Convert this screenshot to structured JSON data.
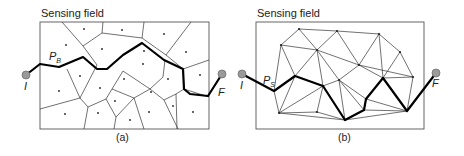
{
  "panels": [
    {
      "id": "a",
      "title": "Sensing field",
      "caption": "(a)",
      "frame": {
        "x": 40,
        "y": 22,
        "w": 169,
        "h": 107
      },
      "path_label": {
        "main": "P",
        "sub": "B",
        "x": 49,
        "y": 60
      },
      "start": {
        "label": "I",
        "x": 26,
        "y": 75,
        "lx": 24,
        "ly": 90
      },
      "end": {
        "label": "F",
        "x": 222,
        "y": 74,
        "lx": 218,
        "ly": 96
      },
      "edges": [
        [
          62,
          22,
          83,
          46
        ],
        [
          103,
          22,
          102,
          33
        ],
        [
          144,
          22,
          142,
          38
        ],
        [
          191,
          22,
          166,
          55
        ],
        [
          83,
          46,
          102,
          33
        ],
        [
          102,
          33,
          142,
          38
        ],
        [
          142,
          38,
          166,
          55
        ],
        [
          83,
          46,
          97,
          65
        ],
        [
          166,
          55,
          183,
          69
        ],
        [
          183,
          69,
          209,
          60
        ],
        [
          183,
          69,
          184,
          89
        ],
        [
          184,
          89,
          209,
          97
        ],
        [
          40,
          109,
          80,
          98
        ],
        [
          80,
          98,
          97,
          65
        ],
        [
          80,
          98,
          67,
          69
        ],
        [
          80,
          98,
          88,
          107
        ],
        [
          88,
          107,
          84,
          129
        ],
        [
          88,
          107,
          106,
          99
        ],
        [
          106,
          99,
          112,
          89
        ],
        [
          106,
          99,
          116,
          117
        ],
        [
          116,
          117,
          114,
          129
        ],
        [
          116,
          117,
          134,
          98
        ],
        [
          134,
          98,
          150,
          89
        ],
        [
          134,
          98,
          144,
          129
        ],
        [
          112,
          89,
          123,
          71
        ],
        [
          112,
          89,
          134,
          98
        ],
        [
          150,
          89,
          163,
          77
        ],
        [
          150,
          89,
          164,
          100
        ],
        [
          164,
          100,
          178,
          129
        ],
        [
          164,
          100,
          176,
          94
        ],
        [
          176,
          94,
          184,
          89
        ],
        [
          176,
          94,
          177,
          129
        ],
        [
          123,
          71,
          150,
          89
        ],
        [
          163,
          77,
          165,
          60
        ]
      ],
      "sites": [
        [
          84,
          29
        ],
        [
          122,
          30
        ],
        [
          164,
          34
        ],
        [
          66,
          45
        ],
        [
          102,
          49
        ],
        [
          144,
          51
        ],
        [
          186,
          52
        ],
        [
          80,
          76
        ],
        [
          143,
          64
        ],
        [
          100,
          88
        ],
        [
          124,
          79
        ],
        [
          168,
          79
        ],
        [
          59,
          91
        ],
        [
          200,
          75
        ],
        [
          115,
          101
        ],
        [
          151,
          92
        ],
        [
          65,
          114
        ],
        [
          98,
          113
        ],
        [
          130,
          120
        ],
        [
          149,
          112
        ],
        [
          173,
          106
        ],
        [
          193,
          112
        ]
      ],
      "path": [
        [
          26,
          75
        ],
        [
          40,
          64
        ],
        [
          59,
          67
        ],
        [
          83,
          57
        ],
        [
          97,
          69
        ],
        [
          107,
          69
        ],
        [
          123,
          55
        ],
        [
          142,
          43
        ],
        [
          164,
          60
        ],
        [
          183,
          69
        ],
        [
          184,
          89
        ],
        [
          190,
          94
        ],
        [
          208,
          96
        ],
        [
          222,
          74
        ]
      ]
    },
    {
      "id": "b",
      "title": "Sensing field",
      "caption": "(b)",
      "frame": {
        "x": 256,
        "y": 22,
        "w": 168,
        "h": 107
      },
      "path_label": {
        "main": "P",
        "sub": "S",
        "x": 263,
        "y": 84
      },
      "start": {
        "label": "I",
        "x": 242,
        "y": 74,
        "lx": 240,
        "ly": 89
      },
      "end": {
        "label": "F",
        "x": 436,
        "y": 73,
        "lx": 432,
        "ly": 87
      },
      "vertices": [
        [
          299,
          29
        ],
        [
          337,
          31
        ],
        [
          379,
          34
        ],
        [
          281,
          45
        ],
        [
          317,
          50
        ],
        [
          359,
          65
        ],
        [
          400,
          52
        ],
        [
          413,
          77
        ],
        [
          339,
          80
        ],
        [
          383,
          78
        ],
        [
          274,
          91
        ],
        [
          295,
          76
        ],
        [
          323,
          86
        ],
        [
          279,
          113
        ],
        [
          317,
          112
        ],
        [
          345,
          120
        ],
        [
          364,
          110
        ],
        [
          407,
          111
        ],
        [
          366,
          99
        ]
      ],
      "edges": [
        [
          299,
          29,
          337,
          31
        ],
        [
          337,
          31,
          379,
          34
        ],
        [
          299,
          29,
          281,
          45
        ],
        [
          299,
          29,
          317,
          50
        ],
        [
          337,
          31,
          317,
          50
        ],
        [
          337,
          31,
          359,
          65
        ],
        [
          379,
          34,
          359,
          65
        ],
        [
          379,
          34,
          400,
          52
        ],
        [
          379,
          34,
          383,
          78
        ],
        [
          281,
          45,
          317,
          50
        ],
        [
          281,
          45,
          274,
          91
        ],
        [
          281,
          45,
          295,
          76
        ],
        [
          317,
          50,
          295,
          76
        ],
        [
          317,
          50,
          323,
          86
        ],
        [
          317,
          50,
          359,
          65
        ],
        [
          317,
          50,
          339,
          80
        ],
        [
          359,
          65,
          339,
          80
        ],
        [
          359,
          65,
          383,
          78
        ],
        [
          359,
          65,
          413,
          77
        ],
        [
          400,
          52,
          413,
          77
        ],
        [
          400,
          52,
          383,
          78
        ],
        [
          413,
          77,
          407,
          111
        ],
        [
          413,
          77,
          383,
          78
        ],
        [
          383,
          78,
          366,
          99
        ],
        [
          383,
          78,
          407,
          111
        ],
        [
          339,
          80,
          323,
          86
        ],
        [
          339,
          80,
          366,
          99
        ],
        [
          339,
          80,
          345,
          120
        ],
        [
          339,
          80,
          364,
          110
        ],
        [
          295,
          76,
          274,
          91
        ],
        [
          295,
          76,
          279,
          113
        ],
        [
          295,
          76,
          323,
          86
        ],
        [
          323,
          86,
          279,
          113
        ],
        [
          323,
          86,
          317,
          112
        ],
        [
          323,
          86,
          345,
          120
        ],
        [
          274,
          91,
          279,
          113
        ],
        [
          279,
          113,
          317,
          112
        ],
        [
          317,
          112,
          345,
          120
        ],
        [
          345,
          120,
          364,
          110
        ],
        [
          364,
          110,
          366,
          99
        ],
        [
          364,
          110,
          407,
          111
        ],
        [
          366,
          99,
          407,
          111
        ],
        [
          279,
          113,
          345,
          120
        ],
        [
          345,
          120,
          407,
          111
        ]
      ],
      "path": [
        [
          242,
          74
        ],
        [
          274,
          91
        ],
        [
          295,
          76
        ],
        [
          323,
          86
        ],
        [
          345,
          120
        ],
        [
          364,
          110
        ],
        [
          366,
          99
        ],
        [
          383,
          78
        ],
        [
          407,
          111
        ],
        [
          436,
          73
        ]
      ]
    }
  ]
}
